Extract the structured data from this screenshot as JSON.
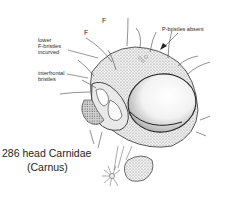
{
  "figure": {
    "number": "286",
    "caption_line1": "286  head Carnidae",
    "caption_line2": "(Carnus)"
  },
  "labels": {
    "f_upper": "F",
    "f_lower": "F",
    "lower_f_bristles_line1": "lower",
    "lower_f_bristles_line2": "F-bristles",
    "lower_f_bristles_line3": "incurved",
    "interfrontal_line1": "interfrontal",
    "interfrontal_line2": "bristles",
    "p_bristles_absent": "P-bristles absent"
  },
  "colors": {
    "ink": "#2a2a2a",
    "background": "#ffffff",
    "shade": "#bdbdbd"
  }
}
